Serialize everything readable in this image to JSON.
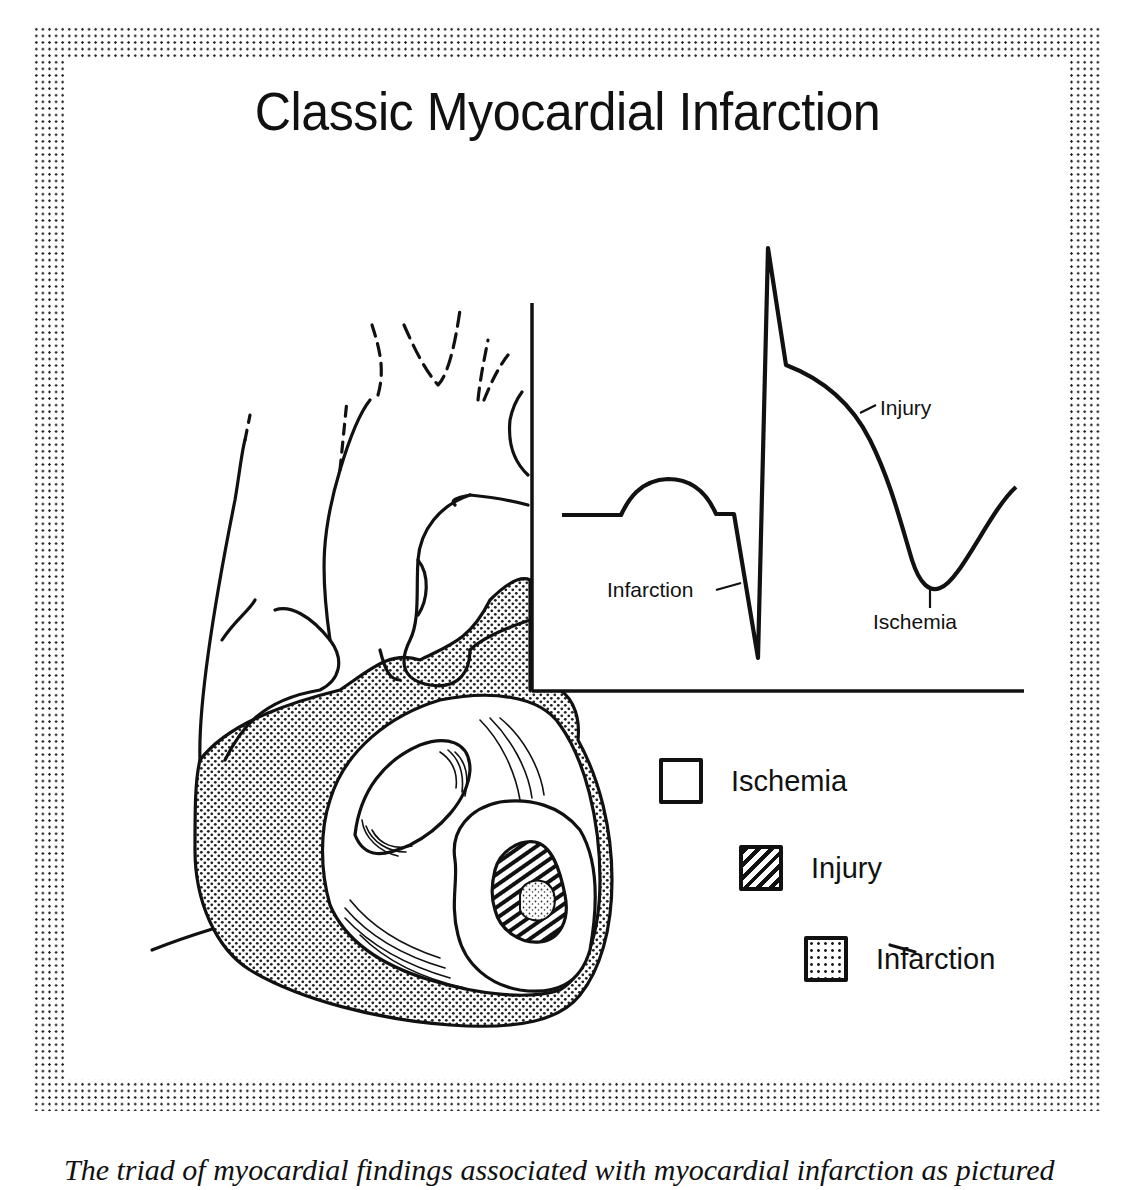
{
  "figure": {
    "title": "Classic Myocardial Infarction",
    "border_style": "dotted halftone frame"
  },
  "ecg_inset": {
    "labels": {
      "infarction": "Infarction",
      "injury": "Injury",
      "ischemia": "Ischemia"
    },
    "description": "ECG complex: baseline, P wave, deep Q wave, R spike, elevated ST segment, inverted T wave"
  },
  "heart_illustration": {
    "zones": [
      "Ischemia",
      "Injury",
      "Infarction"
    ]
  },
  "legend": {
    "items": [
      {
        "label": "Ischemia",
        "pattern": "blank"
      },
      {
        "label": "Injury",
        "pattern": "hatched"
      },
      {
        "label": "Infarction",
        "pattern": "stippled"
      }
    ]
  },
  "caption": {
    "text": "The triad of myocardial findings associated with myocardial infarction as pictured"
  },
  "colors": {
    "ink": "#111111",
    "background": "#ffffff"
  }
}
